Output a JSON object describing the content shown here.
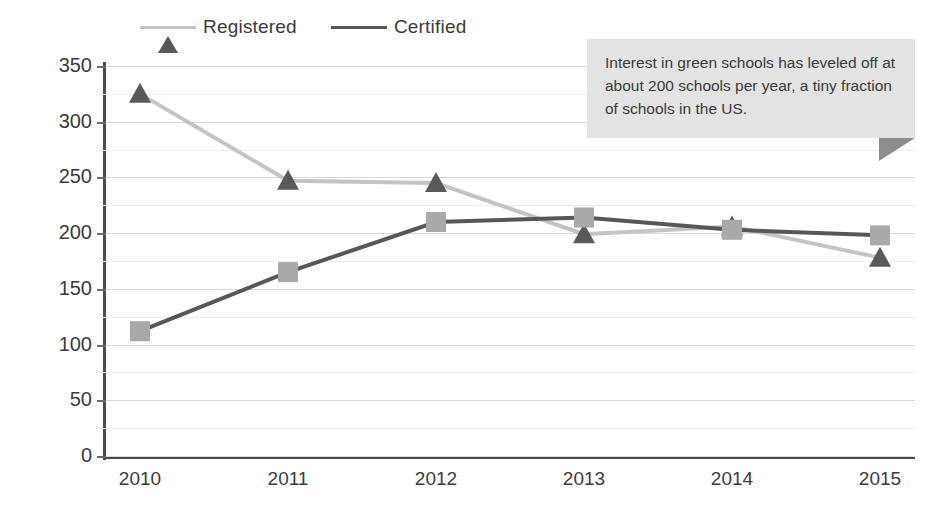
{
  "chart_data": {
    "type": "line",
    "title": "",
    "xlabel": "",
    "ylabel": "",
    "categories": [
      "2010",
      "2011",
      "2012",
      "2013",
      "2014",
      "2015"
    ],
    "series": [
      {
        "name": "Registered",
        "values": [
          325,
          247,
          245,
          199,
          206,
          178
        ],
        "marker": "triangle",
        "marker_color": "#595959",
        "line_color": "#c4c4c4"
      },
      {
        "name": "Certified",
        "values": [
          112,
          165,
          210,
          214,
          203,
          198
        ],
        "marker": "square",
        "marker_color": "#a9a9a9",
        "line_color": "#575757"
      }
    ],
    "ylim": [
      0,
      350
    ],
    "yticks": [
      0,
      50,
      100,
      150,
      200,
      250,
      300,
      350
    ],
    "ytick_labels": [
      "0",
      "50",
      "100",
      "150",
      "200",
      "250",
      "300",
      "350"
    ],
    "minor_tick_step": 25,
    "grid": true,
    "legend_position": "top"
  },
  "legend": {
    "items": [
      {
        "label": "Registered",
        "icon": "triangle-marker-icon"
      },
      {
        "label": "Certified",
        "icon": "square-marker-icon"
      }
    ]
  },
  "annotation": {
    "text": "Interest in green schools has leveled off at about 200 schools per year, a tiny fraction of schools in the US.",
    "background": "#e3e3e3",
    "tail_color": "#8d8d8d"
  },
  "axis": {
    "y_labels": [
      "350",
      "300",
      "250",
      "200",
      "150",
      "100",
      "50",
      "0"
    ],
    "x_labels": [
      "2010",
      "2011",
      "2012",
      "2013",
      "2014",
      "2015"
    ]
  },
  "colors": {
    "axis": "#4a4a4a",
    "gridline_major": "#d9d9d9",
    "gridline_minor": "#ededed",
    "text": "#3a3a3a"
  }
}
